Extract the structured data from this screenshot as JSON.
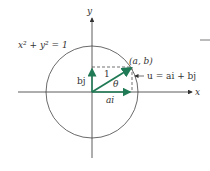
{
  "diagram": {
    "equation": "x² + y² = 1",
    "axis_x": "x",
    "axis_y": "y",
    "point": "(a, b)",
    "vector_u": "u = ai + bj",
    "label_bj": "bj",
    "label_ai": "ai",
    "label_one": "1",
    "label_theta": "θ",
    "colors": {
      "vector": "#1f7a55",
      "axis": "#333333",
      "circle": "#444444"
    }
  }
}
